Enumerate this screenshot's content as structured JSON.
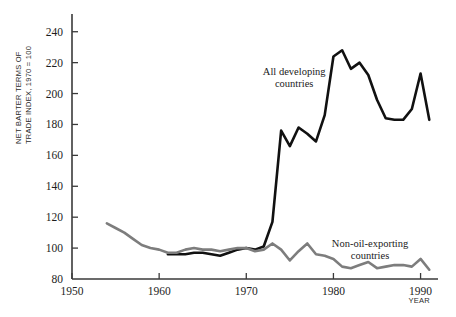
{
  "chart_data": {
    "type": "line",
    "title": "",
    "xlabel": "YEAR",
    "ylabel": "NET BARTER TERMS OF TRADE INDEX, 1970 = 100",
    "ylabel_lines": [
      "NET BARTER TERMS OF",
      "TRADE INDEX, 1970 = 100"
    ],
    "xlim": [
      1950,
      1992
    ],
    "ylim": [
      80,
      245
    ],
    "xticks": [
      1950,
      1960,
      1970,
      1980,
      1990
    ],
    "xtick_labels": [
      "1950",
      "1960",
      "1970",
      "1980",
      "1990"
    ],
    "yticks": [
      80,
      100,
      120,
      140,
      160,
      180,
      200,
      220,
      240
    ],
    "ytick_labels": [
      "80",
      "100",
      "120",
      "140",
      "160",
      "180",
      "200",
      "220",
      "240"
    ],
    "grid": false,
    "legend_position": "inline-annotation",
    "series": [
      {
        "name": "All developing countries",
        "color": "#111111",
        "width": 2.6,
        "label_x": 1975.5,
        "label_y": 212,
        "x": [
          1961,
          1962,
          1963,
          1964,
          1965,
          1966,
          1967,
          1968,
          1969,
          1970,
          1971,
          1972,
          1973,
          1974,
          1975,
          1976,
          1977,
          1978,
          1979,
          1980,
          1981,
          1982,
          1983,
          1984,
          1985,
          1986,
          1987,
          1988,
          1989,
          1990,
          1991
        ],
        "values": [
          96,
          96,
          96,
          97,
          97,
          96,
          95,
          97,
          99,
          100,
          99,
          101,
          117,
          176,
          166,
          178,
          174,
          169,
          186,
          224,
          228,
          216,
          220,
          212,
          196,
          184,
          183,
          183,
          190,
          213,
          183
        ]
      },
      {
        "name": "Non-oil-exporting countries",
        "color": "#7d7d7d",
        "width": 2.6,
        "label_x": 1984.2,
        "label_y": 101,
        "x": [
          1954,
          1955,
          1956,
          1957,
          1958,
          1959,
          1960,
          1961,
          1962,
          1963,
          1964,
          1965,
          1966,
          1967,
          1968,
          1969,
          1970,
          1971,
          1972,
          1973,
          1974,
          1975,
          1976,
          1977,
          1978,
          1979,
          1980,
          1981,
          1982,
          1983,
          1984,
          1985,
          1986,
          1987,
          1988,
          1989,
          1990,
          1991
        ],
        "values": [
          116,
          113,
          110,
          106,
          102,
          100,
          99,
          97,
          97,
          99,
          100,
          99,
          99,
          98,
          99,
          100,
          100,
          98,
          99,
          103,
          99,
          92,
          98,
          103,
          96,
          95,
          93,
          88,
          87,
          89,
          91,
          87,
          88,
          89,
          89,
          88,
          93,
          86
        ]
      }
    ]
  }
}
